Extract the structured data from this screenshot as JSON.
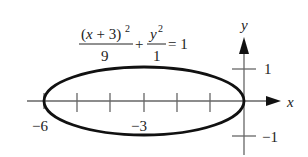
{
  "chart_data": {
    "type": "line",
    "title": "",
    "equation": {
      "num1": "(x + 3)",
      "num1_exp": "2",
      "den1": "9",
      "plus": "+",
      "num2": "y",
      "num2_exp": "2",
      "den2": "1",
      "rhs": "= 1"
    },
    "curve": "ellipse",
    "center": [
      -3,
      0
    ],
    "semi_axes": {
      "a": 3,
      "b": 1
    },
    "xlabel": "x",
    "ylabel": "y",
    "xlim": [
      -6,
      1
    ],
    "ylim": [
      -1,
      1.5
    ],
    "x_ticks": [
      -6,
      -5,
      -4,
      -3,
      -2,
      -1,
      0
    ],
    "x_tick_labels": {
      "-6": "−6",
      "-3": "−3"
    },
    "y_ticks": [
      1,
      -1
    ],
    "y_tick_labels": [
      "1",
      "−1"
    ],
    "grid": false,
    "legend": null
  },
  "labels": {
    "x_axis": "x",
    "y_axis": "y",
    "tick_neg6": "−6",
    "tick_neg3": "−3",
    "tick_pos1": "1",
    "tick_neg1": "−1"
  },
  "colors": {
    "curve": "#111111",
    "axis": "#555555",
    "text": "#222222"
  }
}
